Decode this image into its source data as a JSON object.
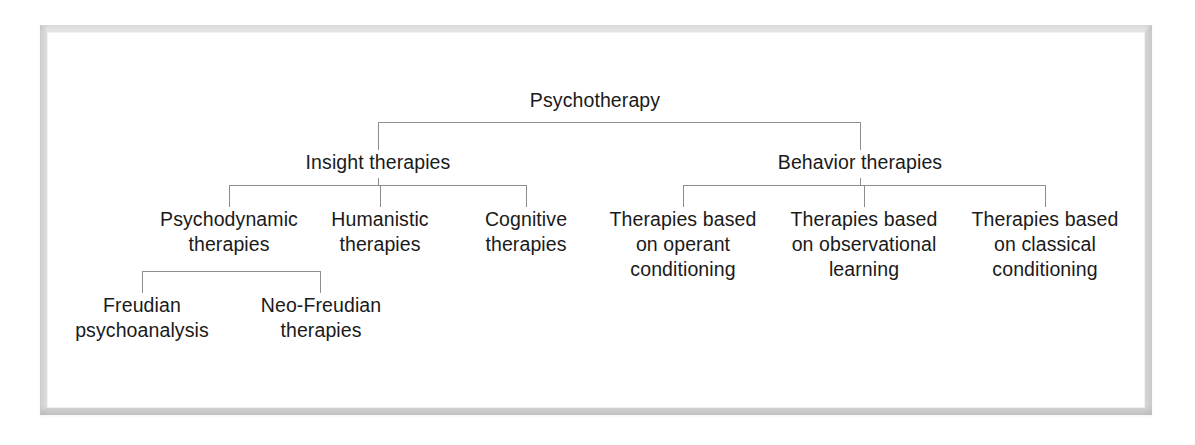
{
  "diagram": {
    "line_color": "#8e8e8e",
    "text_color": "#1a1a1a",
    "background": "#ffffff",
    "nodes": {
      "root": "Psychotherapy",
      "level2": [
        "Insight therapies",
        "Behavior therapies"
      ],
      "level3_insight": [
        "Psychodynamic\ntherapies",
        "Humanistic\ntherapies",
        "Cognitive\ntherapies"
      ],
      "level3_behavior": [
        "Therapies based\non operant\nconditioning",
        "Therapies based\non observational\nlearning",
        "Therapies based\non classical\nconditioning"
      ],
      "level4_psychodynamic": [
        "Freudian\npsychoanalysis",
        "Neo-Freudian\ntherapies"
      ]
    }
  }
}
